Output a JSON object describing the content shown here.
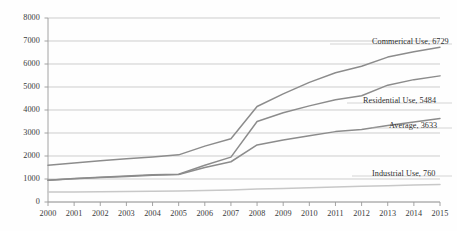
{
  "chart_data": {
    "type": "line",
    "title": "",
    "xlabel": "",
    "ylabel": "",
    "x": [
      2000,
      2001,
      2002,
      2003,
      2004,
      2005,
      2006,
      2007,
      2008,
      2009,
      2010,
      2011,
      2012,
      2013,
      2014,
      2015
    ],
    "xtick_labels": [
      "2000",
      "2001",
      "2002",
      "2003",
      "2004",
      "2005",
      "2006",
      "2007",
      "2008",
      "2009",
      "2010",
      "2011",
      "2012",
      "2013",
      "2014",
      "2015"
    ],
    "ytick_labels": [
      "0",
      "1000",
      "2000",
      "3000",
      "4000",
      "5000",
      "6000",
      "7000",
      "8000"
    ],
    "ytick_values": [
      0,
      1000,
      2000,
      3000,
      4000,
      5000,
      6000,
      7000,
      8000
    ],
    "ylim": [
      0,
      8000
    ],
    "xlim": [
      2000,
      2015
    ],
    "grid": "horizontal",
    "legend": "right-end-labels",
    "series": [
      {
        "name": "Commerical Use",
        "end_value": 6729,
        "color": "#8c8c8c",
        "label": "Commerical Use, 6729",
        "values": [
          1600,
          1700,
          1790,
          1880,
          1960,
          2050,
          2430,
          2750,
          4150,
          4700,
          5200,
          5620,
          5900,
          6300,
          6530,
          6729
        ]
      },
      {
        "name": "Residential Use",
        "end_value": 5484,
        "color": "#8c8c8c",
        "label": "Residential Use, 5484",
        "values": [
          950,
          1020,
          1080,
          1130,
          1180,
          1210,
          1600,
          1950,
          3500,
          3880,
          4180,
          4450,
          4620,
          5080,
          5320,
          5484
        ]
      },
      {
        "name": "Average",
        "end_value": 3633,
        "color": "#8c8c8c",
        "label": "Average, 3633",
        "values": [
          950,
          1010,
          1060,
          1110,
          1160,
          1200,
          1500,
          1750,
          2480,
          2700,
          2880,
          3060,
          3150,
          3330,
          3480,
          3633
        ]
      },
      {
        "name": "Industrial Use",
        "end_value": 760,
        "color": "#c8c8c8",
        "label": "Industrial Use, 760",
        "values": [
          430,
          440,
          450,
          460,
          470,
          480,
          500,
          520,
          560,
          590,
          620,
          650,
          680,
          710,
          735,
          760
        ]
      }
    ],
    "annotations": [
      {
        "text": "Commerical Use, 6729",
        "x_px": 372,
        "y_px": 37
      },
      {
        "text": "Residential Use, 5484",
        "x_px": 363,
        "y_px": 96
      },
      {
        "text": "Average, 3633",
        "x_px": 389,
        "y_px": 121
      },
      {
        "text": "Industrial Use, 760",
        "x_px": 372,
        "y_px": 169
      }
    ],
    "colors": {
      "axis": "#9a9a9a",
      "grid": "#b9b9b9",
      "line_dark": "#8c8c8c",
      "line_light": "#c8c8c8",
      "text": "#333333",
      "background": "#ffffff"
    }
  }
}
